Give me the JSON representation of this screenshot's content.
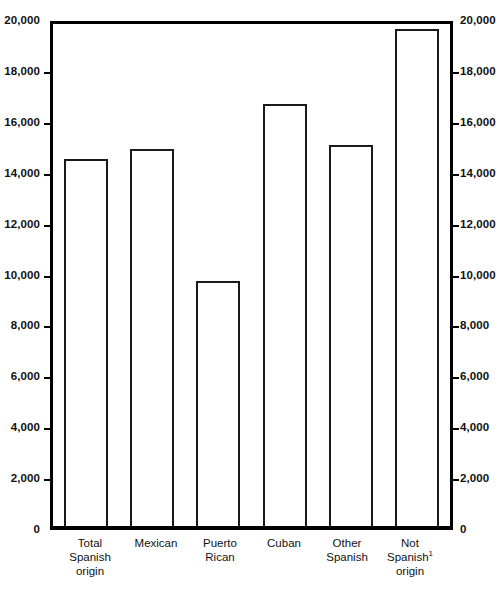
{
  "chart_data": {
    "type": "bar",
    "title": "",
    "subtitle": "",
    "xlabel": "",
    "ylabel": "",
    "ylim": [
      0,
      20000
    ],
    "ytick_step": 2000,
    "grid": false,
    "legend": null,
    "dual_axis": true,
    "categories": [
      "Total Spanish origin",
      "Mexican",
      "Puerto Rican",
      "Cuban",
      "Other Spanish",
      "Not Spanish origin"
    ],
    "values": [
      14500,
      14900,
      9700,
      16700,
      15050,
      19650
    ],
    "y_tick_labels": [
      "0",
      "2,000",
      "4,000",
      "6,000",
      "8,000",
      "10,000",
      "12,000",
      "14,000",
      "16,000",
      "18,000",
      "20,000"
    ],
    "y_tick_values": [
      0,
      2000,
      4000,
      6000,
      8000,
      10000,
      12000,
      14000,
      16000,
      18000,
      20000
    ],
    "annotations": [
      {
        "text": "1",
        "type": "footnote-marker",
        "attached_to": "Not Spanish origin"
      }
    ],
    "colors": {
      "bar_fill": "#ffffff",
      "bar_stroke": "#1a1a1a",
      "axis": "#000000",
      "background": "#ffffff",
      "text": "#111111"
    }
  },
  "categories_display": [
    {
      "line1": "Total",
      "line2": "Spanish",
      "line3": "origin",
      "sup": ""
    },
    {
      "line1": "Mexican",
      "line2": "",
      "line3": "",
      "sup": ""
    },
    {
      "line1": "Puerto",
      "line2": "Rican",
      "line3": "",
      "sup": ""
    },
    {
      "line1": "Cuban",
      "line2": "",
      "line3": "",
      "sup": ""
    },
    {
      "line1": "Other",
      "line2": "Spanish",
      "line3": "",
      "sup": ""
    },
    {
      "line1": "Not",
      "line2": "Spanish",
      "line3": "origin",
      "sup": "1"
    }
  ]
}
